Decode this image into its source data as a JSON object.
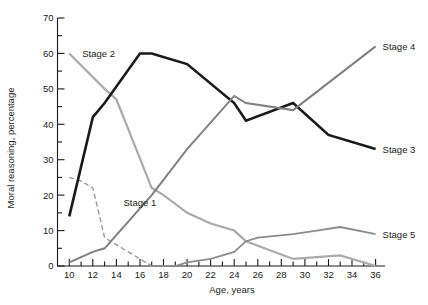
{
  "chart_data": {
    "type": "line",
    "title": "",
    "xlabel": "Age, years",
    "ylabel": "Moral reasoning, percentage",
    "xlim": [
      9,
      36.8
    ],
    "ylim": [
      0,
      70
    ],
    "x_ticks": [
      10,
      12,
      14,
      16,
      18,
      20,
      22,
      24,
      26,
      28,
      30,
      32,
      34,
      36
    ],
    "x_tick_labels": [
      "10",
      "12",
      "14",
      "16",
      "18",
      "20",
      "22",
      "24",
      "26",
      "28",
      "30",
      "32",
      "34",
      "36"
    ],
    "x_minor_step": 1,
    "y_ticks": [
      0,
      10,
      20,
      30,
      40,
      50,
      60,
      70
    ],
    "y_tick_labels": [
      "0",
      "10",
      "20",
      "30",
      "40",
      "50",
      "60",
      "70"
    ],
    "y_minor_step": 5,
    "grid": false,
    "legend": "inline-end-labels",
    "series": [
      {
        "name": "Stage 1",
        "label": "Stage 1",
        "color": "#999999",
        "width": 1.4,
        "dash": "5,3",
        "label_x": 14.6,
        "label_y": 18,
        "label_anchor": "start",
        "x": [
          10,
          11,
          12,
          13,
          17
        ],
        "y": [
          25,
          24,
          22,
          8,
          0
        ]
      },
      {
        "name": "Stage 2",
        "label": "Stage 2",
        "color": "#aaaaaa",
        "width": 2.2,
        "dash": "",
        "label_x": 11.1,
        "label_y": 60,
        "label_anchor": "start",
        "x": [
          10,
          13,
          14,
          17,
          18,
          20,
          22,
          24,
          25,
          29,
          33,
          36
        ],
        "y": [
          60,
          50,
          47,
          22,
          20,
          15,
          12,
          10,
          7,
          2,
          3,
          0
        ]
      },
      {
        "name": "Stage 3",
        "label": "Stage 3",
        "color": "#1a1a1a",
        "width": 2.6,
        "dash": "",
        "label_x": 36.6,
        "label_y": 33,
        "label_anchor": "start",
        "x": [
          10,
          12,
          13,
          16,
          17,
          20,
          24,
          25,
          29,
          32,
          36
        ],
        "y": [
          14,
          42,
          46,
          60,
          60,
          57,
          46,
          41,
          46,
          37,
          33
        ]
      },
      {
        "name": "Stage 4",
        "label": "Stage 4",
        "color": "#808080",
        "width": 2.0,
        "dash": "",
        "label_x": 36.6,
        "label_y": 62,
        "label_anchor": "start",
        "x": [
          10,
          12,
          13,
          17,
          20,
          24,
          25,
          29,
          36
        ],
        "y": [
          1,
          4,
          5,
          20,
          33,
          48,
          46,
          44,
          62
        ]
      },
      {
        "name": "Stage 5",
        "label": "Stage 5",
        "color": "#8c8c8c",
        "width": 1.8,
        "dash": "",
        "label_x": 36.6,
        "label_y": 9,
        "label_anchor": "start",
        "x": [
          17,
          19,
          20,
          22,
          24,
          25,
          26,
          29,
          31,
          33,
          36
        ],
        "y": [
          0,
          0,
          1,
          2,
          4,
          7,
          8,
          9,
          10,
          11,
          9
        ]
      }
    ]
  }
}
